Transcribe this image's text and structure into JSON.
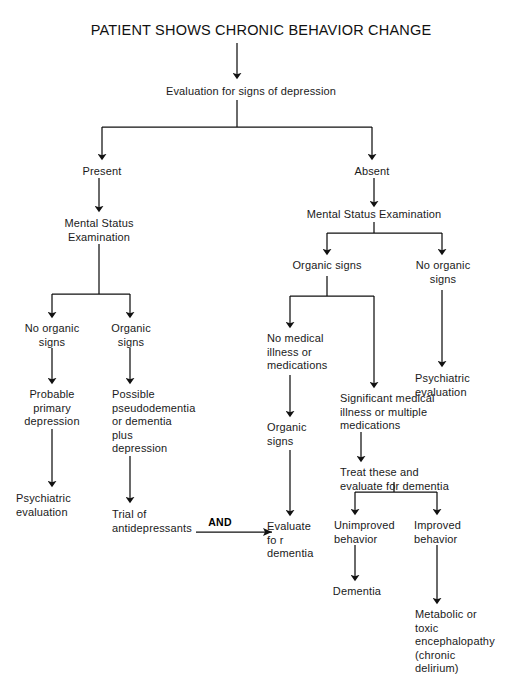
{
  "diagram": {
    "title": "PATIENT SHOWS CHRONIC BEHAVIOR CHANGE",
    "type": "clinical-decision-flowchart",
    "connector_labels": {
      "and": "AND"
    },
    "nodes": {
      "evaluation_depression": "Evaluation for signs of depression",
      "present": "Present",
      "absent": "Absent",
      "mse_left": "Mental Status\nExamination",
      "mse_right": "Mental  Status  Examination",
      "left_no_organic_signs": "No organic\nsigns",
      "left_organic_signs": "Organic\nsigns",
      "probable_primary_depression": "Probable\nprimary\ndepression",
      "psychiatric_evaluation_left": "Psychiatric\nevaluation",
      "possible_pseudodementia": "Possible\npseudodementia\nor dementia\nplus\ndepression",
      "trial_antidepressants": "Trial  of\nantidepressants",
      "right_organic_signs": "Organic signs",
      "right_no_organic_signs": "No organic\nsigns",
      "psychiatric_evaluation_right": "Psychiatric\nevaluation",
      "no_medical_illness": "No medical\nillness  or\nmedications",
      "organic_signs_mid": "Organic\nsigns",
      "evaluate_for_dementia": "Evaluate\nfo r\ndementia",
      "significant_medical_illness": "Significant  medical\nillness  or  multiple\nmedications",
      "treat_and_evaluate": "Treat these and\nevaluate for dementia",
      "unimproved_behavior": "Unimproved\nbehavior",
      "improved_behavior": "Improved\nbehavior",
      "dementia": "Dementia",
      "metabolic_toxic": "Metabolic or\ntoxic\nencephalopathy\n(chronic\ndelirium)"
    }
  },
  "style": {
    "stroke": "#111111",
    "background": "#ffffff"
  }
}
